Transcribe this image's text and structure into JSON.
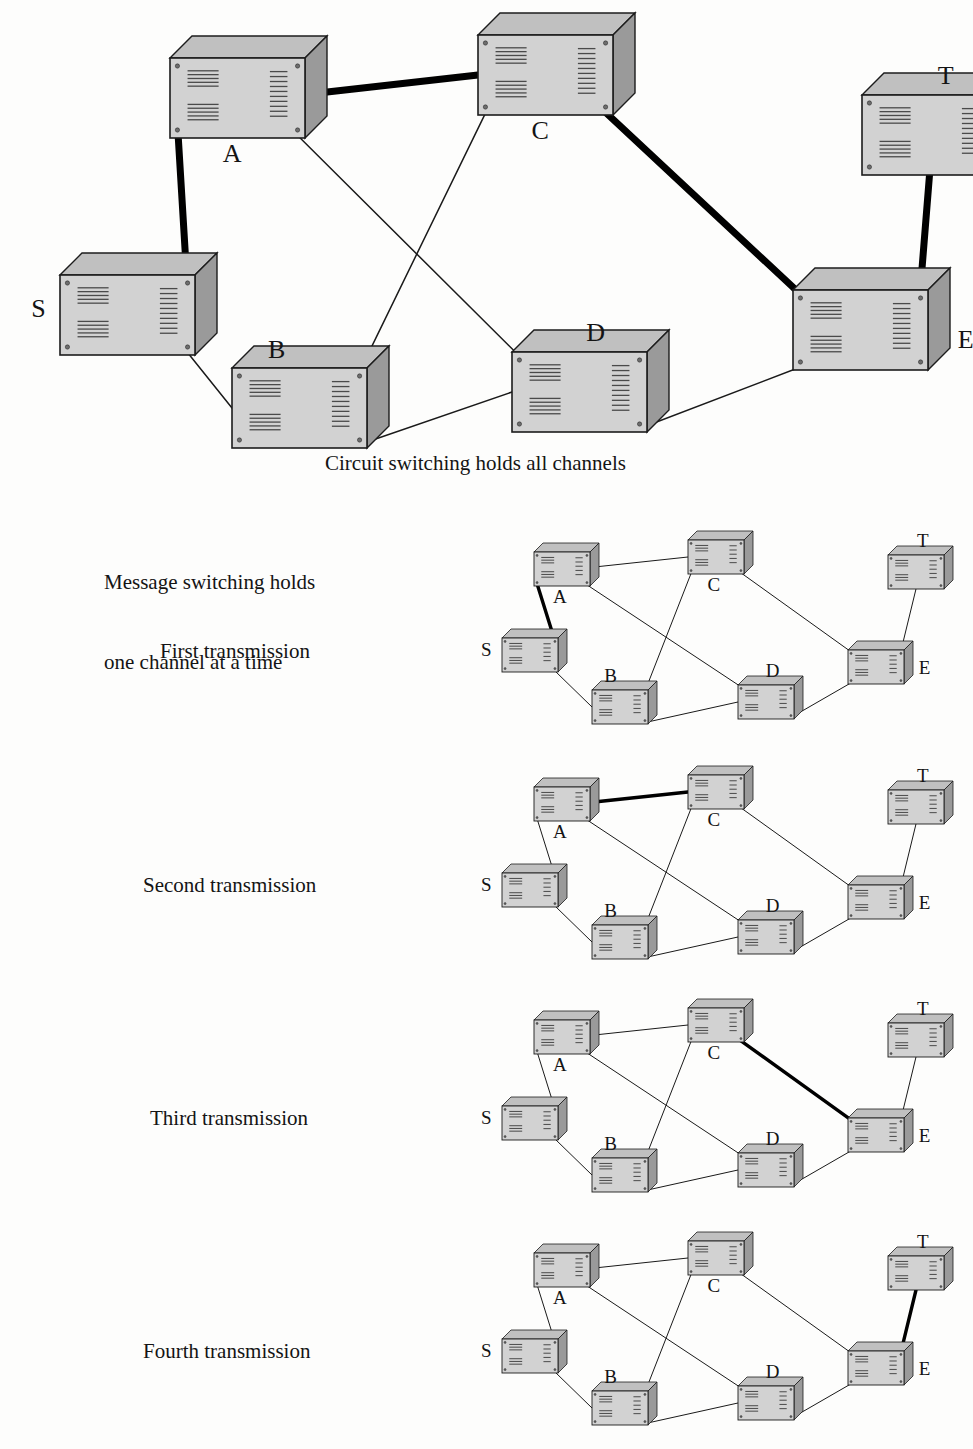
{
  "page": {
    "background": "#fdfdfc",
    "ink": "#141414",
    "box_face": "#d2d2d2",
    "box_top": "#c0c0c0",
    "box_side": "#9a9a9a",
    "box_outline": "#1c1c1c",
    "vent_color": "#4a4a4a",
    "link_color": "#1a1a1a",
    "highlight_color": "#000000"
  },
  "captions": {
    "circuit": "Circuit switching holds all channels",
    "message_line1": "Message switching holds",
    "message_line2": "one channel at a time",
    "first": "First transmission",
    "second": "Second transmission",
    "third": "Third transmission",
    "fourth": "Fourth transmission"
  },
  "topology": {
    "node_ids": [
      "S",
      "A",
      "B",
      "C",
      "D",
      "E",
      "T"
    ],
    "links": [
      {
        "from": "S",
        "to": "A"
      },
      {
        "from": "S",
        "to": "B"
      },
      {
        "from": "A",
        "to": "C"
      },
      {
        "from": "A",
        "to": "D"
      },
      {
        "from": "B",
        "to": "C"
      },
      {
        "from": "C",
        "to": "E"
      },
      {
        "from": "B",
        "to": "D"
      },
      {
        "from": "D",
        "to": "E"
      },
      {
        "from": "E",
        "to": "T"
      }
    ]
  },
  "main_diagram": {
    "name": "circuit-switching-network",
    "nodes": [
      {
        "id": "S",
        "label": "S",
        "x": 60,
        "y": 275,
        "w": 135,
        "h": 80,
        "label_pos": "left"
      },
      {
        "id": "A",
        "label": "A",
        "x": 170,
        "y": 58,
        "w": 135,
        "h": 80,
        "label_pos": "below"
      },
      {
        "id": "B",
        "label": "B",
        "x": 232,
        "y": 368,
        "w": 135,
        "h": 80,
        "label_pos": "above-left"
      },
      {
        "id": "C",
        "label": "C",
        "x": 478,
        "y": 35,
        "w": 135,
        "h": 80,
        "label_pos": "below"
      },
      {
        "id": "D",
        "label": "D",
        "x": 512,
        "y": 352,
        "w": 135,
        "h": 80,
        "label_pos": "above-right"
      },
      {
        "id": "E",
        "label": "E",
        "x": 793,
        "y": 290,
        "w": 135,
        "h": 80,
        "label_pos": "right"
      },
      {
        "id": "T",
        "label": "T",
        "x": 862,
        "y": 95,
        "w": 135,
        "h": 80,
        "label_pos": "above-right"
      }
    ],
    "highlighted": [
      "S-A",
      "A-C",
      "C-E",
      "E-T"
    ],
    "caption_key": "circuit"
  },
  "mini_diagrams": [
    {
      "name": "first-transmission-network",
      "label_key": "first",
      "top": 530,
      "highlighted": [
        "S-A"
      ]
    },
    {
      "name": "second-transmission-network",
      "label_key": "second",
      "top": 765,
      "highlighted": [
        "A-C"
      ]
    },
    {
      "name": "third-transmission-network",
      "label_key": "third",
      "top": 998,
      "highlighted": [
        "C-E"
      ]
    },
    {
      "name": "fourth-transmission-network",
      "label_key": "fourth",
      "top": 1231,
      "highlighted": [
        "E-T"
      ]
    }
  ],
  "mini_layout": {
    "nodes": [
      {
        "id": "S",
        "label": "S",
        "x": 10,
        "y": 108,
        "w": 56,
        "h": 34,
        "label_pos": "left"
      },
      {
        "id": "A",
        "label": "A",
        "x": 42,
        "y": 22,
        "w": 56,
        "h": 34,
        "label_pos": "below"
      },
      {
        "id": "B",
        "label": "B",
        "x": 100,
        "y": 160,
        "w": 56,
        "h": 34,
        "label_pos": "above-left"
      },
      {
        "id": "C",
        "label": "C",
        "x": 196,
        "y": 10,
        "w": 56,
        "h": 34,
        "label_pos": "below"
      },
      {
        "id": "D",
        "label": "D",
        "x": 246,
        "y": 155,
        "w": 56,
        "h": 34,
        "label_pos": "above-right"
      },
      {
        "id": "E",
        "label": "E",
        "x": 356,
        "y": 120,
        "w": 56,
        "h": 34,
        "label_pos": "right"
      },
      {
        "id": "T",
        "label": "T",
        "x": 396,
        "y": 25,
        "w": 56,
        "h": 34,
        "label_pos": "above-right"
      }
    ],
    "offset_x": 492,
    "width": 470,
    "height": 215
  }
}
